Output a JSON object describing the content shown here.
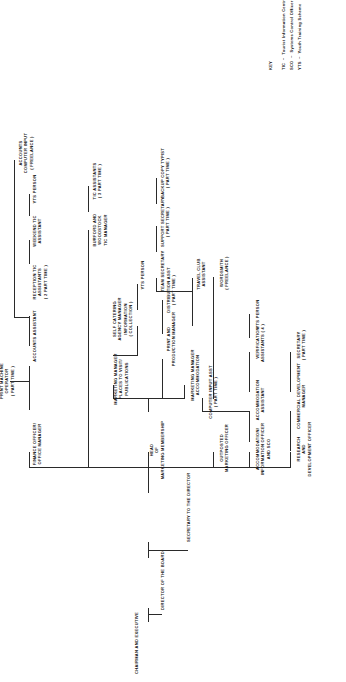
{
  "top": {
    "chairman": "CHAIRMAN AND EXECUTIVE",
    "director": "DIRECTOR OF THE BOARD",
    "secretary": "SECRETARY TO THE DIRECTOR"
  },
  "nodes": {
    "research": "RESEARCH\nAND\nDEVELOPMENT OFFICER",
    "commercial_dev": "COMMERCIAL DEVELOPMENT\nMANAGER",
    "secretary_pt": "SECRETARY\n( PART TIME )",
    "accom_info": "ACCOMMODATION/\nINFORMATION OFFICER\nAND SCO",
    "accom_asst": "ACCOMMODATION\nASSISTANT",
    "computer_input_asst": "COMPUTER INPUT ASST\n( PART TIME )",
    "verification_asst": "VERIFICATION\nASSISTANTS ( 4 )",
    "yts_person_1": "YTS PERSON",
    "outposted": "OUTPOSTED\nMARKETING OFFICER",
    "head_marketing": "HEAD\nOF\nMARKETING MEMBERSHIP",
    "marketing_accom": "MARKETING MANAGER\nACCOMMODATION",
    "print_production": "PRINT AND\nPRODUCTION MANAGER",
    "distribution_asst": "DISTRIBUTION ASST\n( PART TIME )",
    "wordsmith": "WORDSMITH\n( FREELANCE )",
    "marketing_visit": "MARKETING MANAGER\nPLACES TO VISIT/\nPUBLICATIONS",
    "self_catering": "SELF CATERING\nAGENCY MANAGER\nINFORMATION\n( COLLECTION )",
    "yts_person_2": "YTS PERSON",
    "travel_club": "TRAVEL CLUB\nASSISTANT",
    "team_secretary": "TEAM SECRETARY",
    "support_secretary": "SUPPORT SECRETARY\n( PART TIME )",
    "backup_typist": "BACKUP COPY TYPIST\n( PART TIME )",
    "finance_officer": "FINANCE OFFICER/\nOFFICE MANAGER",
    "print_machine_op": "PRINT MACHINE\nOPERATOR\n( PART TIME )",
    "accounts_asst": "ACCOUNTS ASSISTANT",
    "reception_tic": "RECEPTION TIC\nASSISTANTS\n( 2 PART TIME )",
    "weekend_tic": "WEEKEND TIC\nASSISTANT",
    "yts_person_3": "YTS PERSON",
    "accounts_computer": "ACCOUNTS\nCOMPUTER INPUT\n( FREELANCE )",
    "burford_woodstock": "BURFORD AND\nWOODSTOCK\nTIC MANAGER",
    "tic_assistants": "TIC ASSISTANTS\n( 3 PART TIME )"
  },
  "key": {
    "heading": "KEY",
    "entries": [
      "TIC  –  Tourist Information Centre",
      "SCO  –  Systems Control Officer",
      "YTS  –  Youth Training Scheme"
    ]
  }
}
